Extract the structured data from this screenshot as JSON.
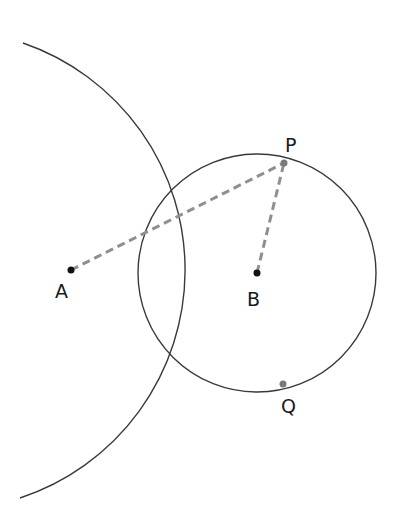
{
  "diagram": {
    "points": {
      "A": {
        "label": "A",
        "x": 71,
        "y": 270
      },
      "B": {
        "label": "B",
        "x": 257,
        "y": 273
      },
      "P": {
        "label": "P",
        "x": 284,
        "y": 163
      },
      "Q": {
        "label": "Q",
        "x": 283,
        "y": 384
      }
    },
    "circles": {
      "large": {
        "center": "A",
        "radius": 240,
        "style": "solid arc"
      },
      "small": {
        "center": "B",
        "radius": 119,
        "style": "solid circle"
      }
    },
    "segments": [
      {
        "from": "A",
        "to": "P",
        "style": "dashed"
      },
      {
        "from": "B",
        "to": "P",
        "style": "dashed"
      }
    ],
    "colors": {
      "curve": "#3a3a3a",
      "dashed": "#8f8f8f",
      "point": "#111111",
      "intersection": "#7a7a7a"
    }
  }
}
